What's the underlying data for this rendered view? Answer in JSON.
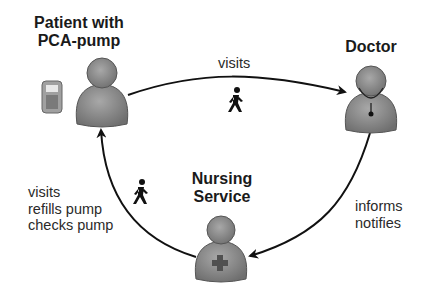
{
  "nodes": {
    "patient": {
      "title_line1": "Patient with",
      "title_line2": "PCA-pump"
    },
    "doctor": {
      "title": "Doctor"
    },
    "nursing": {
      "title_line1": "Nursing",
      "title_line2": "Service"
    }
  },
  "edges": {
    "patient_to_doctor": {
      "label": "visits",
      "icon": "walking-person-icon"
    },
    "doctor_to_nursing": {
      "line1": "informs",
      "line2": "notifies"
    },
    "nursing_to_patient": {
      "line1": "visits",
      "line2": "refills pump",
      "line3": "checks pump",
      "icon": "walking-person-icon"
    }
  },
  "colors": {
    "person_fill": "#8a8a8a",
    "person_stroke": "#555555",
    "arrow": "#111111",
    "cross": "#5a5a5a"
  }
}
